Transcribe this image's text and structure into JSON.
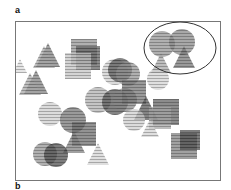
{
  "figure": {
    "panel_a_label": "a",
    "panel_b_label": "b",
    "frame": {
      "x": 15,
      "y": 21,
      "w": 206,
      "h": 160
    },
    "highlight_ellipse": {
      "cx": 180,
      "cy": 48,
      "rx": 36,
      "ry": 26,
      "stroke": "#333333"
    },
    "shapes": [
      {
        "type": "triangle",
        "cx": 48,
        "cy": 55,
        "size": 24,
        "shade": 0.55
      },
      {
        "type": "triangle",
        "cx": 44,
        "cy": 57,
        "size": 22,
        "shade": 0.35
      },
      {
        "type": "triangle",
        "cx": 36,
        "cy": 82,
        "size": 24,
        "shade": 0.55
      },
      {
        "type": "triangle",
        "cx": 30,
        "cy": 84,
        "size": 22,
        "shade": 0.35
      },
      {
        "type": "square",
        "cx": 84,
        "cy": 52,
        "size": 26,
        "shade": 0.45
      },
      {
        "type": "square",
        "cx": 88,
        "cy": 58,
        "size": 24,
        "shade": 0.7
      },
      {
        "type": "square",
        "cx": 78,
        "cy": 66,
        "size": 26,
        "shade": 0.2
      },
      {
        "type": "circle",
        "cx": 115,
        "cy": 72,
        "size": 26,
        "shade": 0.15
      },
      {
        "type": "circle",
        "cx": 120,
        "cy": 70,
        "size": 24,
        "shade": 0.75
      },
      {
        "type": "circle",
        "cx": 128,
        "cy": 74,
        "size": 24,
        "shade": 0.45
      },
      {
        "type": "circle",
        "cx": 162,
        "cy": 44,
        "size": 26,
        "shade": 0.45
      },
      {
        "type": "circle",
        "cx": 182,
        "cy": 42,
        "size": 26,
        "shade": 0.5
      },
      {
        "type": "triangle",
        "cx": 161,
        "cy": 63,
        "size": 20,
        "shade": 0.35
      },
      {
        "type": "triangle",
        "cx": 184,
        "cy": 57,
        "size": 22,
        "shade": 0.6
      },
      {
        "type": "circle",
        "cx": 158,
        "cy": 79,
        "size": 22,
        "shade": 0.12
      },
      {
        "type": "circle",
        "cx": 98,
        "cy": 100,
        "size": 26,
        "shade": 0.3
      },
      {
        "type": "circle",
        "cx": 115,
        "cy": 102,
        "size": 26,
        "shade": 0.75
      },
      {
        "type": "circle",
        "cx": 125,
        "cy": 100,
        "size": 24,
        "shade": 0.5
      },
      {
        "type": "square",
        "cx": 134,
        "cy": 92,
        "size": 24,
        "shade": 0.6
      },
      {
        "type": "triangle",
        "cx": 146,
        "cy": 108,
        "size": 24,
        "shade": 0.75
      },
      {
        "type": "circle",
        "cx": 134,
        "cy": 120,
        "size": 22,
        "shade": 0.15
      },
      {
        "type": "square",
        "cx": 166,
        "cy": 112,
        "size": 26,
        "shade": 0.7
      },
      {
        "type": "square",
        "cx": 160,
        "cy": 118,
        "size": 22,
        "shade": 0.35
      },
      {
        "type": "triangle",
        "cx": 150,
        "cy": 128,
        "size": 18,
        "shade": 0.12
      },
      {
        "type": "circle",
        "cx": 50,
        "cy": 114,
        "size": 24,
        "shade": 0.15
      },
      {
        "type": "circle",
        "cx": 73,
        "cy": 120,
        "size": 26,
        "shade": 0.6
      },
      {
        "type": "square",
        "cx": 84,
        "cy": 134,
        "size": 24,
        "shade": 0.65
      },
      {
        "type": "triangle",
        "cx": 74,
        "cy": 142,
        "size": 22,
        "shade": 0.55
      },
      {
        "type": "triangle",
        "cx": 98,
        "cy": 154,
        "size": 22,
        "shade": 0.12
      },
      {
        "type": "circle",
        "cx": 45,
        "cy": 154,
        "size": 24,
        "shade": 0.45
      },
      {
        "type": "circle",
        "cx": 56,
        "cy": 155,
        "size": 24,
        "shade": 0.8
      },
      {
        "type": "square",
        "cx": 184,
        "cy": 146,
        "size": 26,
        "shade": 0.55
      },
      {
        "type": "square",
        "cx": 190,
        "cy": 140,
        "size": 20,
        "shade": 0.8
      },
      {
        "type": "triangle",
        "cx": 20,
        "cy": 66,
        "size": 14,
        "shade": 0.08
      }
    ]
  }
}
